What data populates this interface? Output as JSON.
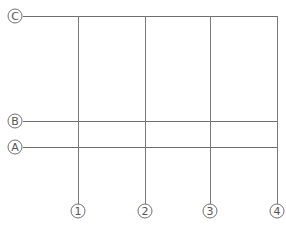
{
  "diagram": {
    "type": "structural-grid-plan",
    "colors": {
      "background": "#ffffff",
      "horizontal_line": "#6e6e6e",
      "vertical_line": "#7a7a7a",
      "bubble_stroke": "#707070",
      "label": "#555555"
    },
    "horizontal_axes": [
      {
        "label": "C",
        "y": 16,
        "x_start": 23,
        "x_end": 278,
        "bubble": {
          "cx": 15,
          "cy": 16,
          "r": 7
        }
      },
      {
        "label": "B",
        "y": 121,
        "x_start": 23,
        "x_end": 278,
        "bubble": {
          "cx": 15,
          "cy": 121,
          "r": 7
        }
      },
      {
        "label": "A",
        "y": 147,
        "x_start": 23,
        "x_end": 278,
        "bubble": {
          "cx": 15,
          "cy": 147,
          "r": 7
        }
      }
    ],
    "vertical_axes": [
      {
        "label": "1",
        "x": 78,
        "y_start": 16,
        "y_end": 204,
        "bubble": {
          "cx": 78,
          "cy": 211,
          "r": 7
        }
      },
      {
        "label": "2",
        "x": 145,
        "y_start": 16,
        "y_end": 204,
        "bubble": {
          "cx": 145,
          "cy": 211,
          "r": 7
        }
      },
      {
        "label": "3",
        "x": 210,
        "y_start": 16,
        "y_end": 204,
        "bubble": {
          "cx": 210,
          "cy": 211,
          "r": 7
        }
      },
      {
        "label": "4",
        "x": 277,
        "y_start": 16,
        "y_end": 204,
        "bubble": {
          "cx": 277,
          "cy": 211,
          "r": 7
        }
      }
    ]
  }
}
